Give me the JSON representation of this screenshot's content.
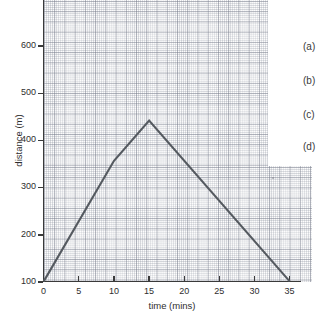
{
  "chart_data": {
    "type": "line",
    "title": "",
    "xlabel": "time (mins)",
    "ylabel": "distance (m)",
    "xlim": [
      0,
      35
    ],
    "ylim": [
      0,
      700
    ],
    "grid": true,
    "grid_style": "graph-paper",
    "legend": "none",
    "line_color": "#555a60",
    "x": [
      0,
      10,
      15,
      35
    ],
    "y": [
      0,
      300,
      400,
      0
    ],
    "series": [
      {
        "name": "journey",
        "points": [
          {
            "x": 0,
            "y": 0
          },
          {
            "x": 10,
            "y": 300
          },
          {
            "x": 15,
            "y": 400
          },
          {
            "x": 35,
            "y": 0
          }
        ]
      }
    ],
    "xticks": [
      0,
      5,
      10,
      15,
      20,
      25,
      30,
      35
    ],
    "xticklabels": [
      "0",
      "5",
      "10",
      "15",
      "20",
      "25",
      "30",
      "35"
    ],
    "yticks": [
      100,
      200,
      300,
      400,
      500,
      600
    ],
    "yticklabels": [
      "100",
      "200",
      "300",
      "400",
      "500",
      "600"
    ]
  },
  "axes": {
    "x_title": "time (mins)",
    "y_title": "distance (m)",
    "x_tick_labels": [
      "0",
      "5",
      "10",
      "15",
      "20",
      "25",
      "30",
      "35"
    ],
    "y_tick_labels": [
      "100",
      "200",
      "300",
      "400",
      "500",
      "600"
    ]
  },
  "options": {
    "items": [
      {
        "label": "(a)"
      },
      {
        "label": "(b)"
      },
      {
        "label": "(c)"
      },
      {
        "label": "(d)"
      }
    ]
  },
  "colors": {
    "line": "#555a60",
    "axis": "#3a3a3a",
    "text": "#2e2e2e",
    "grid_major": "#787d8c",
    "grid_minor": "#878c9b",
    "paper": "#fdfdfd",
    "background": "#ffffff"
  }
}
